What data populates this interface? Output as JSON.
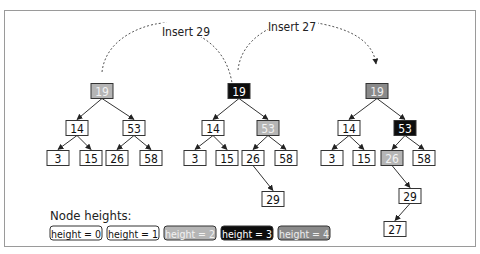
{
  "diagram": {
    "colors": {
      "h0": {
        "fill": "#ffffff",
        "text": "#111111"
      },
      "h1": {
        "fill": "#ffffff",
        "text": "#111111"
      },
      "h2": {
        "fill": "#b5b5b5",
        "text": "#f2f2f2"
      },
      "h3": {
        "fill": "#0d0d0d",
        "text": "#ffffff"
      },
      "h4": {
        "fill": "#8a8a8a",
        "text": "#eeeeee"
      }
    },
    "arcs": [
      {
        "label": "Insert 29",
        "from": [
          102,
          72
        ],
        "to": [
          233,
          97
        ],
        "peak_y": 28,
        "label_x": 186,
        "label_y": 32
      },
      {
        "label": "Insert 27",
        "from": [
          238,
          70
        ],
        "to": [
          376,
          70
        ],
        "peak_y": 24,
        "label_x": 292,
        "label_y": 27
      }
    ],
    "trees": [
      {
        "name": "tree-initial",
        "nodes": [
          {
            "id": "a19",
            "value": "19",
            "x": 102,
            "y": 91,
            "h": 2
          },
          {
            "id": "a14",
            "value": "14",
            "x": 77,
            "y": 128,
            "h": 1
          },
          {
            "id": "a53",
            "value": "53",
            "x": 134,
            "y": 128,
            "h": 1
          },
          {
            "id": "a3",
            "value": "3",
            "x": 58,
            "y": 158,
            "h": 0
          },
          {
            "id": "a15",
            "value": "15",
            "x": 91,
            "y": 158,
            "h": 0
          },
          {
            "id": "a26",
            "value": "26",
            "x": 117,
            "y": 158,
            "h": 0
          },
          {
            "id": "a58",
            "value": "58",
            "x": 151,
            "y": 158,
            "h": 0
          }
        ],
        "edges": [
          [
            "a19",
            "a14"
          ],
          [
            "a19",
            "a53"
          ],
          [
            "a14",
            "a3"
          ],
          [
            "a14",
            "a15"
          ],
          [
            "a53",
            "a26"
          ],
          [
            "a53",
            "a58"
          ]
        ]
      },
      {
        "name": "tree-after-insert-29",
        "nodes": [
          {
            "id": "b19",
            "value": "19",
            "x": 239,
            "y": 91,
            "h": 3
          },
          {
            "id": "b14",
            "value": "14",
            "x": 213,
            "y": 128,
            "h": 1
          },
          {
            "id": "b53",
            "value": "53",
            "x": 268,
            "y": 128,
            "h": 2
          },
          {
            "id": "b3",
            "value": "3",
            "x": 195,
            "y": 158,
            "h": 0
          },
          {
            "id": "b15",
            "value": "15",
            "x": 227,
            "y": 158,
            "h": 0
          },
          {
            "id": "b26",
            "value": "26",
            "x": 253,
            "y": 158,
            "h": 1
          },
          {
            "id": "b58",
            "value": "58",
            "x": 286,
            "y": 158,
            "h": 0
          },
          {
            "id": "b29",
            "value": "29",
            "x": 273,
            "y": 199,
            "h": 0
          }
        ],
        "edges": [
          [
            "b19",
            "b14"
          ],
          [
            "b19",
            "b53"
          ],
          [
            "b14",
            "b3"
          ],
          [
            "b14",
            "b15"
          ],
          [
            "b53",
            "b26"
          ],
          [
            "b53",
            "b58"
          ],
          [
            "b26",
            "b29"
          ]
        ]
      },
      {
        "name": "tree-after-insert-27",
        "nodes": [
          {
            "id": "c19",
            "value": "19",
            "x": 377,
            "y": 91,
            "h": 4
          },
          {
            "id": "c14",
            "value": "14",
            "x": 349,
            "y": 128,
            "h": 1
          },
          {
            "id": "c53",
            "value": "53",
            "x": 405,
            "y": 128,
            "h": 3
          },
          {
            "id": "c3",
            "value": "3",
            "x": 332,
            "y": 158,
            "h": 0
          },
          {
            "id": "c15",
            "value": "15",
            "x": 364,
            "y": 158,
            "h": 0
          },
          {
            "id": "c26",
            "value": "26",
            "x": 392,
            "y": 158,
            "h": 2
          },
          {
            "id": "c58",
            "value": "58",
            "x": 424,
            "y": 158,
            "h": 0
          },
          {
            "id": "c29",
            "value": "29",
            "x": 410,
            "y": 196,
            "h": 1
          },
          {
            "id": "c27",
            "value": "27",
            "x": 395,
            "y": 229,
            "h": 0
          }
        ],
        "edges": [
          [
            "c19",
            "c14"
          ],
          [
            "c19",
            "c53"
          ],
          [
            "c14",
            "c3"
          ],
          [
            "c14",
            "c15"
          ],
          [
            "c53",
            "c26"
          ],
          [
            "c53",
            "c58"
          ],
          [
            "c26",
            "c29"
          ],
          [
            "c29",
            "c27"
          ]
        ]
      }
    ],
    "legend": {
      "title": "Node heights:",
      "items": [
        {
          "label": "height = 0",
          "h": 0
        },
        {
          "label": "height = 1",
          "h": 1
        },
        {
          "label": "height = 2",
          "h": 2
        },
        {
          "label": "height = 3",
          "h": 3
        },
        {
          "label": "height = 4",
          "h": 4
        }
      ]
    }
  }
}
